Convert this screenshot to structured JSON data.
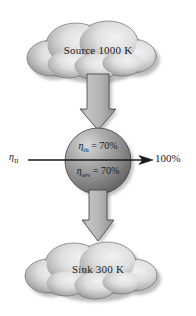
{
  "figure": {
    "background_color": "#ffffff",
    "width": 196,
    "height": 316
  },
  "source": {
    "shape": "cloud",
    "label": "Source 1000 K",
    "temperature": "1000 K",
    "fill_light": "#e8e8e8",
    "fill_dark": "#8a8a8a"
  },
  "sink": {
    "shape": "cloud",
    "label": "Sink 300 K",
    "temperature": "300 K",
    "fill_light": "#e8e8e8",
    "fill_dark": "#8a8a8a"
  },
  "engine": {
    "shape": "sphere",
    "eta_thermal": {
      "symbol": "η",
      "subscript": "th",
      "equals": " = ",
      "value": "70%"
    },
    "eta_reversible": {
      "symbol": "η",
      "subscript": "rev",
      "equals": " = ",
      "value": "70%"
    },
    "fill_light": "#c9c9c9",
    "fill_dark": "#5a5a5a"
  },
  "arrows": {
    "heat_in": {
      "direction": "down",
      "from": "source",
      "to": "engine",
      "fill": "#b3b3b3"
    },
    "heat_out": {
      "direction": "down",
      "from": "engine",
      "to": "sink",
      "fill": "#b3b3b3"
    },
    "work": {
      "direction": "right",
      "left_label": {
        "symbol": "η",
        "subscript": "II"
      },
      "right_label": "100%",
      "stroke": "#1a1a1a"
    }
  },
  "colors": {
    "line": "#1a1a1a",
    "text": "#1a1a1a",
    "arrow_fill": "#b3b3b3",
    "arrow_stroke": "#4d4d4d"
  }
}
